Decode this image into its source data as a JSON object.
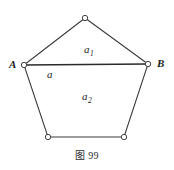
{
  "figure": {
    "caption": "图 99",
    "stroke_color": "#3a3a3a",
    "emphasis_stroke_color": "#2a2a2a",
    "vertex_fill": "#ffffff",
    "background": "#ffffff",
    "vertex_labels": [
      {
        "name": "A",
        "text": "A",
        "x": 24,
        "y": 65,
        "label_x": 10,
        "label_y": 59
      },
      {
        "name": "B",
        "text": "B",
        "x": 148,
        "y": 64,
        "label_x": 156,
        "label_y": 58
      }
    ],
    "vertices": [
      {
        "name": "apex",
        "x": 85,
        "y": 18
      },
      {
        "name": "A",
        "x": 24,
        "y": 65
      },
      {
        "name": "B",
        "x": 148,
        "y": 64
      },
      {
        "name": "bottom-left",
        "x": 48,
        "y": 137
      },
      {
        "name": "bottom-right",
        "x": 124,
        "y": 137
      }
    ],
    "region_labels": [
      {
        "name": "a1",
        "base": "a",
        "sub": "1",
        "x": 84,
        "y": 44
      },
      {
        "name": "a",
        "base": "a",
        "sub": "",
        "x": 47,
        "y": 69
      },
      {
        "name": "a2",
        "base": "a",
        "sub": "2",
        "x": 82,
        "y": 91
      }
    ],
    "polygon_points": "85,18 148,64 124,137 48,137 24,65",
    "divider_segment": {
      "x1": 24,
      "y1": 65,
      "x2": 148,
      "y2": 64
    }
  }
}
